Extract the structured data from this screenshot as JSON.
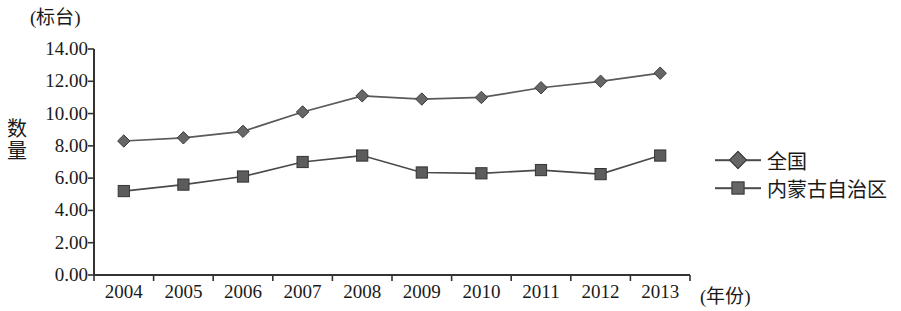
{
  "chart_data": {
    "type": "line",
    "title": "",
    "unit_label": "(标台)",
    "ylabel": "数量",
    "xlabel": "(年份)",
    "categories": [
      "2004",
      "2005",
      "2006",
      "2007",
      "2008",
      "2009",
      "2010",
      "2011",
      "2012",
      "2013"
    ],
    "ylim": [
      0,
      14
    ],
    "ytick_labels": [
      "0.00",
      "2.00",
      "4.00",
      "6.00",
      "8.00",
      "10.00",
      "12.00",
      "14.00"
    ],
    "ytick_values": [
      0,
      2,
      4,
      6,
      8,
      10,
      12,
      14
    ],
    "grid": false,
    "legend_position": "right",
    "series": [
      {
        "name": "全国",
        "marker": "diamond",
        "color": "#666666",
        "line_color": "#5a5a5a",
        "values": [
          8.3,
          8.5,
          8.9,
          10.1,
          11.1,
          10.9,
          11.0,
          11.6,
          12.0,
          12.5
        ]
      },
      {
        "name": "内蒙古自治区",
        "marker": "square",
        "color": "#5c5c5c",
        "line_color": "#4a4a4a",
        "values": [
          5.2,
          5.6,
          6.1,
          7.0,
          7.4,
          6.35,
          6.3,
          6.5,
          6.25,
          7.4
        ]
      }
    ]
  },
  "axis": {
    "y_top_px": 49,
    "y_bottom_px": 275,
    "x_left_px": 94,
    "x_right_px": 690
  },
  "legend": {
    "items": [
      {
        "label": "全国",
        "marker": "diamond"
      },
      {
        "label": "内蒙古自治区",
        "marker": "square"
      }
    ]
  }
}
